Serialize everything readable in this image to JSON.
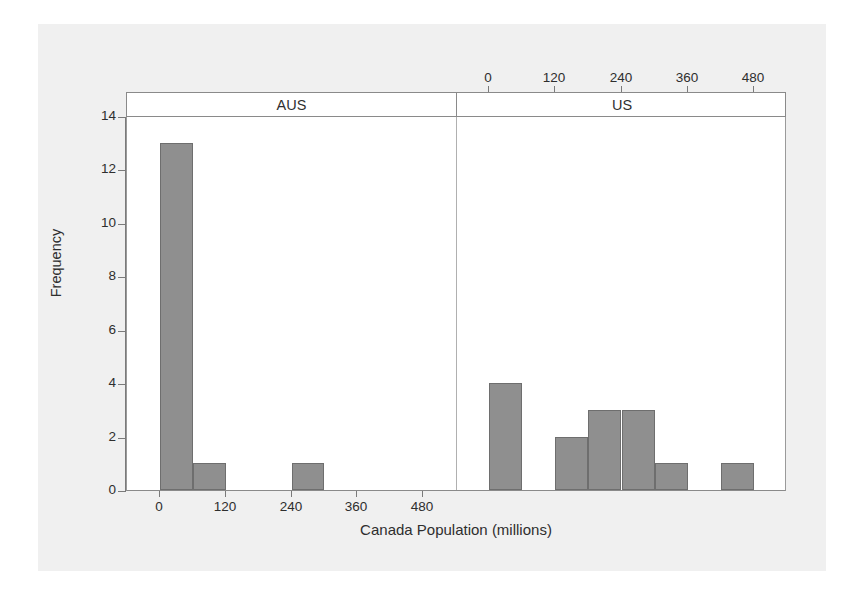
{
  "chart_data": {
    "type": "bar",
    "title": "",
    "xlabel": "Canada Population (millions)",
    "ylabel": "Frequency",
    "xlim": [
      -60,
      540
    ],
    "ylim": [
      0,
      14
    ],
    "bin_width": 60,
    "grid": false,
    "legend": false,
    "panel_layout": "two panels side by side, shared y axis; AUS x-axis ticks on bottom, US x-axis ticks on top",
    "panels": [
      {
        "name": "AUS",
        "x_ticks": [
          0,
          120,
          240,
          360,
          480
        ],
        "x_tick_labels": [
          "0",
          "120",
          "240",
          "360",
          "480"
        ],
        "tick_side": "bottom",
        "bins": [
          {
            "left": 0,
            "right": 60,
            "count": 13
          },
          {
            "left": 60,
            "right": 120,
            "count": 1
          },
          {
            "left": 120,
            "right": 180,
            "count": 0
          },
          {
            "left": 180,
            "right": 240,
            "count": 0
          },
          {
            "left": 240,
            "right": 300,
            "count": 1
          },
          {
            "left": 300,
            "right": 360,
            "count": 0
          },
          {
            "left": 360,
            "right": 420,
            "count": 0
          },
          {
            "left": 420,
            "right": 480,
            "count": 0
          },
          {
            "left": 480,
            "right": 540,
            "count": 0
          }
        ]
      },
      {
        "name": "US",
        "x_ticks": [
          0,
          120,
          240,
          360,
          480
        ],
        "x_tick_labels": [
          "0",
          "120",
          "240",
          "360",
          "480"
        ],
        "tick_side": "top",
        "bins": [
          {
            "left": 0,
            "right": 60,
            "count": 4
          },
          {
            "left": 60,
            "right": 120,
            "count": 0
          },
          {
            "left": 120,
            "right": 180,
            "count": 2
          },
          {
            "left": 180,
            "right": 240,
            "count": 3
          },
          {
            "left": 240,
            "right": 300,
            "count": 3
          },
          {
            "left": 300,
            "right": 360,
            "count": 1
          },
          {
            "left": 360,
            "right": 420,
            "count": 0
          },
          {
            "left": 420,
            "right": 480,
            "count": 1
          }
        ]
      }
    ],
    "y_ticks": [
      0,
      2,
      4,
      6,
      8,
      10,
      12,
      14
    ],
    "y_tick_labels": [
      "0",
      "2",
      "4",
      "6",
      "8",
      "10",
      "12",
      "14"
    ],
    "colors": {
      "bar_fill": "#8f8f8f",
      "bar_edge": "#6e6e6e",
      "plot_background": "#ffffff",
      "figure_background": "#f0f0f0",
      "axis": "#7a7a7a",
      "text": "#2e2e2e"
    }
  },
  "axes": {
    "y_title": "Frequency",
    "x_title": "Canada Population (millions)",
    "y_tick_labels": [
      "0",
      "2",
      "4",
      "6",
      "8",
      "10",
      "12",
      "14"
    ],
    "bottom_tick_labels": [
      "0",
      "120",
      "240",
      "360",
      "480"
    ],
    "top_tick_labels": [
      "0",
      "120",
      "240",
      "360",
      "480"
    ]
  },
  "panel_headers": {
    "left": "AUS",
    "right": "US"
  }
}
